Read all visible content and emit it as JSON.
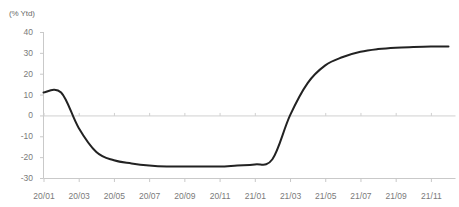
{
  "chart_data": {
    "type": "line",
    "title": "",
    "subtitle": "",
    "ylabel": "(% Ytd)",
    "xlabel": "",
    "ylim": [
      -30,
      40
    ],
    "yticks": [
      40,
      30,
      20,
      10,
      0,
      -10,
      -20,
      -30
    ],
    "ytick_labels": [
      "40",
      "30",
      "20",
      "10",
      "0",
      "-10",
      "-20",
      "-30"
    ],
    "grid": false,
    "zero_line": true,
    "legend": "none",
    "x": [
      "20/01",
      "20/02",
      "20/03",
      "20/04",
      "20/05",
      "20/06",
      "20/07",
      "20/08",
      "20/09",
      "20/10",
      "20/11",
      "20/12",
      "21/01",
      "21/02",
      "21/03",
      "21/04",
      "21/05",
      "21/06",
      "21/07",
      "21/08",
      "21/09",
      "21/10",
      "21/11",
      "21/12"
    ],
    "xtick_labels": [
      "20/01",
      "20/03",
      "20/05",
      "20/07",
      "20/09",
      "20/11",
      "21/01",
      "21/03",
      "21/05",
      "21/07",
      "21/09",
      "21/11"
    ],
    "series": [
      {
        "name": "",
        "color": "#222222",
        "values": [
          11,
          11,
          -6,
          -17.5,
          -21.5,
          -23,
          -24,
          -24.5,
          -24.5,
          -24.5,
          -24.5,
          -24,
          -23.5,
          -21,
          0,
          15.5,
          24,
          28,
          30.5,
          31.8,
          32.5,
          32.8,
          33,
          33
        ]
      }
    ],
    "colors": {
      "line": "#222222",
      "axis": "#c9c9c9",
      "zero_line": "#d0d0d0",
      "tick_text": "#7a7a7a",
      "background": "#ffffff"
    }
  }
}
